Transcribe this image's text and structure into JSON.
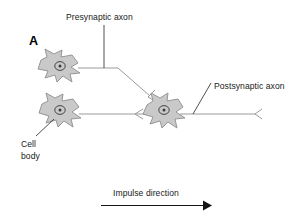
{
  "figure": {
    "panel_letter": "A",
    "background_color": "#ffffff",
    "soma_fill": "#c9c9c9",
    "soma_stroke": "#8d8d8d",
    "axon_color": "#9a9a9a",
    "leader_color": "#3c3c3c",
    "text_color": "#1a1a1a",
    "impulse_color": "#141414"
  },
  "labels": {
    "presynaptic_axon": "Presynaptic axon",
    "postsynaptic_axon": "Postsynaptic axon",
    "cell_body_line1": "Cell",
    "cell_body_line2": "body",
    "impulse_direction": "Impulse direction"
  },
  "diagram": {
    "type": "neuron-synapse-schematic",
    "neurons": [
      {
        "name": "upper-presynaptic-neuron",
        "cx": 60,
        "cy": 67,
        "has_nucleus": true
      },
      {
        "name": "lower-presynaptic-neuron",
        "cx": 60,
        "cy": 110,
        "has_nucleus": true
      },
      {
        "name": "postsynaptic-neuron",
        "cx": 163,
        "cy": 110,
        "has_nucleus": true
      }
    ],
    "synaptic_terminals": 3,
    "axon_paths": [
      "upper-neuron-to-postsynaptic-soma",
      "lower-neuron-to-postsynaptic-soma",
      "postsynaptic-soma-to-right-terminal"
    ]
  }
}
